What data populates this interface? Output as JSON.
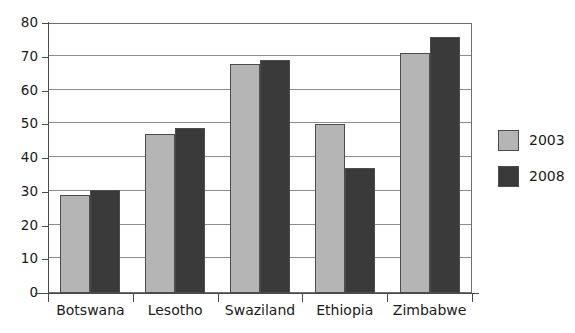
{
  "chart_data": {
    "type": "bar",
    "title": "",
    "subtitle": "",
    "xlabel": "",
    "ylabel": "",
    "categories": [
      "Botswana",
      "Lesotho",
      "Swaziland",
      "Ethiopia",
      "Zimbabwe"
    ],
    "series": [
      {
        "name": "2003",
        "color": "#b5b5b5",
        "values": [
          29,
          47,
          68,
          50,
          71
        ]
      },
      {
        "name": "2008",
        "color": "#3a3a3a",
        "values": [
          30.5,
          49,
          69,
          37,
          76
        ]
      }
    ],
    "ylim": [
      0,
      80
    ],
    "ytick_labels": [
      "0",
      "10",
      "20",
      "30",
      "40",
      "50",
      "60",
      "70",
      "80"
    ],
    "ytick_values": [
      0,
      10,
      20,
      30,
      40,
      50,
      60,
      70,
      80
    ],
    "grid": "horizontal",
    "legend_position": "right",
    "legend_entries": [
      {
        "label": "2003",
        "color": "#b5b5b5"
      },
      {
        "label": "2008",
        "color": "#3a3a3a"
      }
    ]
  },
  "colors": {
    "series_2003": "#b5b5b5",
    "series_2008": "#3a3a3a",
    "axis": "#4a4a4a",
    "gridline": "#8d8d8d",
    "frame": "#6e6e6e",
    "text": "#1a1a1a",
    "background": "#ffffff"
  }
}
